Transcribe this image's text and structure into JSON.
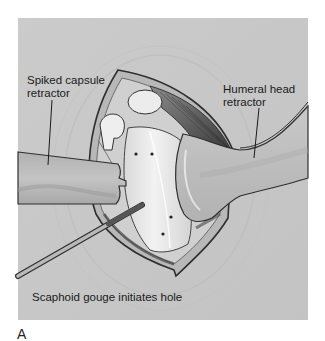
{
  "figure": {
    "panel_letter": "A",
    "labels": {
      "spiked_capsule_retractor": {
        "line1": "Spiked capsule",
        "line2": "retractor"
      },
      "humeral_head_retractor": {
        "line1": "Humeral head",
        "line2": "retractor"
      },
      "scaphoid_gouge": "Scaphoid gouge initiates hole"
    },
    "colors": {
      "background": "#c9c9c9",
      "instrument": "#b5b5b5",
      "bone": "#e6e6e6",
      "muscle": "#555555",
      "outline": "#2a2a2a"
    }
  }
}
